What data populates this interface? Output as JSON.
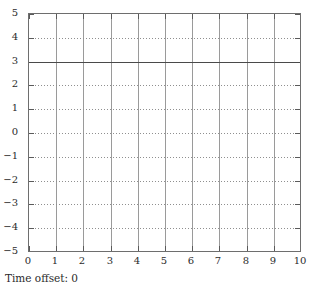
{
  "caption": {
    "text": "Time offset: 0"
  },
  "chart_data": {
    "type": "line",
    "title": "",
    "subtitle": "",
    "xlabel": "",
    "ylabel": "",
    "xlim": [
      0,
      10
    ],
    "ylim": [
      -5,
      5
    ],
    "x_ticks": [
      0,
      1,
      2,
      3,
      4,
      5,
      6,
      7,
      8,
      9,
      10
    ],
    "x_tick_labels": [
      "0",
      "1",
      "2",
      "3",
      "4",
      "5",
      "6",
      "7",
      "8",
      "9",
      "10"
    ],
    "y_ticks": [
      -5,
      -4,
      -3,
      -2,
      -1,
      0,
      1,
      2,
      3,
      4,
      5
    ],
    "y_tick_labels": [
      "−5",
      "−4",
      "−3",
      "−2",
      "−1",
      "0",
      "1",
      "2",
      "3",
      "4",
      "5"
    ],
    "grid": true,
    "grid_x_style": "solid",
    "grid_y_style": "dotted",
    "grid_color": "#9a9a9a",
    "frame_color": "#6e6e6e",
    "legend": null,
    "annotations": [],
    "series": [
      {
        "name": "signal",
        "style": "solid",
        "color": "#4a4a4a",
        "constant_value": 3,
        "x": [
          0,
          10
        ],
        "values": [
          3,
          3
        ]
      }
    ]
  }
}
